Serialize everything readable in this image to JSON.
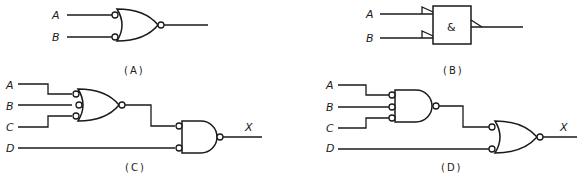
{
  "colors": {
    "line": "#1a1a1a",
    "background": "#ffffff"
  },
  "diagrams": [
    {
      "id": "A",
      "caption": "(A)",
      "description": "2-input OR gate with inverted (bubbled) inputs and inverted output",
      "inputs": [
        "A",
        "B"
      ],
      "output": ""
    },
    {
      "id": "B",
      "caption": "(B)",
      "description": "IEC rectangular AND gate with polarity indicators on inputs and output",
      "symbol": "&",
      "inputs": [
        "A",
        "B"
      ],
      "output": ""
    },
    {
      "id": "C",
      "caption": "(C)",
      "description": "3-input OR gate with bubbled inputs (A,B,C) and bubbled output feeding a 2-input AND gate with bubbled inputs (second input D) and bubbled output X",
      "inputs": [
        "A",
        "B",
        "C",
        "D"
      ],
      "output": "X"
    },
    {
      "id": "D",
      "caption": "(D)",
      "description": "3-input AND gate with bubbled inputs (A,B,C) and bubbled output feeding a 2-input OR gate with bubbled inputs (second input D) and bubbled output X",
      "inputs": [
        "A",
        "B",
        "C",
        "D"
      ],
      "output": "X"
    }
  ]
}
